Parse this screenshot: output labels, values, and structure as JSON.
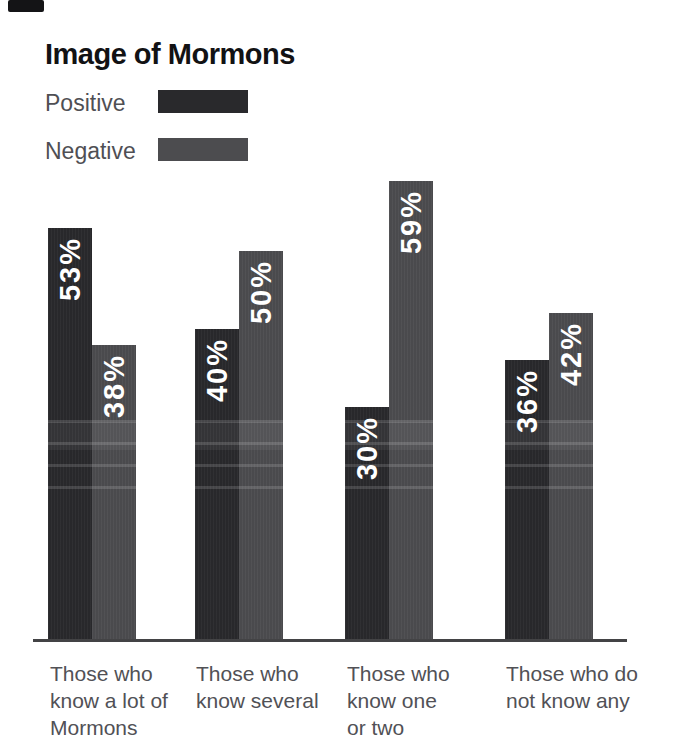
{
  "page": {
    "background": "#ffffff"
  },
  "scan_artifact": {
    "visible": true,
    "color": "#141416"
  },
  "chart": {
    "title": "Image of Mormons",
    "category_lines": [
      [
        "Those who",
        "know a lot of",
        "Mormons"
      ],
      [
        "Those who",
        "know several"
      ],
      [
        "Those who",
        "know one",
        "or two"
      ],
      [
        "Those who do",
        "not know any"
      ]
    ]
  },
  "chart_data": {
    "type": "bar",
    "title": "Image of Mormons",
    "categories": [
      "Those who know a lot of Mormons",
      "Those who know several",
      "Those who know one or two",
      "Those who do not know any"
    ],
    "series": [
      {
        "name": "Positive",
        "color": "#29292c",
        "values": [
          53,
          40,
          30,
          36
        ]
      },
      {
        "name": "Negative",
        "color": "#4c4c4f",
        "values": [
          38,
          50,
          59,
          42
        ]
      }
    ],
    "value_suffix": "%",
    "value_label_color": "#ffffff",
    "value_label_style": "rotated-90-inside-bar-top",
    "ylim": [
      0,
      64
    ],
    "grid": false,
    "legend_position": "top-left",
    "xlabel": "",
    "ylabel": ""
  }
}
